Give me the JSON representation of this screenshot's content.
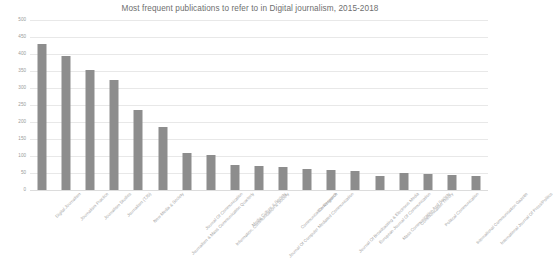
{
  "chart_data": {
    "type": "bar",
    "title": "Most frequent publications to refer to in Digital journalism, 2015-2018",
    "xlabel": "",
    "ylabel": "",
    "ylim": [
      0,
      500
    ],
    "yticks": [
      0,
      50,
      100,
      150,
      200,
      250,
      300,
      350,
      400,
      450,
      500
    ],
    "grid": true,
    "legend": "none",
    "bar_color": "#8d8d8d",
    "categories": [
      "Digital Journalism",
      "Journalism Practice",
      "Journalism Studies",
      "Journalism (TJS)",
      "New Media & Society",
      "Journalism & Mass Communication Quarterly",
      "Journal Of Communication",
      "Information, Communication & Society",
      "Media Culture & Society",
      "Journal Of Computer Mediated Communication",
      "Communication Research",
      "Convergence",
      "Journal Of Broadcasting & Electronic Media",
      "European Journal Of Communication",
      "Mass Communication And Society",
      "Communication Theory",
      "Political Communication",
      "International Communication Gazette",
      "International Journal Of Press/Politics"
    ],
    "values": [
      430,
      393,
      352,
      325,
      235,
      185,
      108,
      103,
      75,
      72,
      68,
      63,
      60,
      57,
      42,
      50,
      47,
      45,
      40
    ]
  }
}
